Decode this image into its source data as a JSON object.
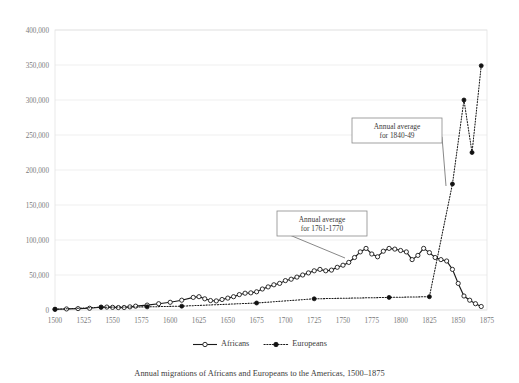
{
  "chart_data": {
    "type": "line",
    "title": "",
    "caption": "Annual migrations of Africans and Europeans to the Americas, 1500–1875",
    "xlabel": "",
    "ylabel": "",
    "xlim": [
      1500,
      1875
    ],
    "ylim": [
      0,
      400000
    ],
    "grid": true,
    "legend_position": "bottom",
    "x_ticks": [
      1500,
      1525,
      1550,
      1575,
      1600,
      1625,
      1650,
      1675,
      1700,
      1725,
      1750,
      1775,
      1800,
      1825,
      1850,
      1875
    ],
    "y_ticks": [
      0,
      50000,
      100000,
      150000,
      200000,
      250000,
      300000,
      350000,
      400000
    ],
    "y_tick_labels": [
      "0",
      "50,000",
      "100,000",
      "150,000",
      "200,000",
      "250,000",
      "300,000",
      "350,000",
      "400,000"
    ],
    "series": [
      {
        "name": "Africans",
        "marker": "open-circle",
        "line_style": "solid",
        "color": "#1a1a1a",
        "points": [
          [
            1500,
            1000
          ],
          [
            1510,
            1500
          ],
          [
            1520,
            2000
          ],
          [
            1530,
            2500
          ],
          [
            1540,
            4000
          ],
          [
            1545,
            4200
          ],
          [
            1550,
            3800
          ],
          [
            1555,
            3500
          ],
          [
            1560,
            3600
          ],
          [
            1565,
            4500
          ],
          [
            1570,
            5500
          ],
          [
            1580,
            7000
          ],
          [
            1590,
            9000
          ],
          [
            1600,
            11000
          ],
          [
            1610,
            14000
          ],
          [
            1620,
            18000
          ],
          [
            1625,
            19000
          ],
          [
            1630,
            16000
          ],
          [
            1635,
            13500
          ],
          [
            1640,
            13000
          ],
          [
            1645,
            15000
          ],
          [
            1650,
            17000
          ],
          [
            1655,
            19000
          ],
          [
            1660,
            22000
          ],
          [
            1665,
            24000
          ],
          [
            1670,
            24500
          ],
          [
            1675,
            26000
          ],
          [
            1680,
            30000
          ],
          [
            1685,
            33000
          ],
          [
            1690,
            36000
          ],
          [
            1695,
            38000
          ],
          [
            1700,
            42000
          ],
          [
            1705,
            44000
          ],
          [
            1710,
            47000
          ],
          [
            1715,
            50000
          ],
          [
            1720,
            53000
          ],
          [
            1725,
            56000
          ],
          [
            1730,
            58000
          ],
          [
            1735,
            56000
          ],
          [
            1740,
            57000
          ],
          [
            1745,
            61000
          ],
          [
            1750,
            64000
          ],
          [
            1755,
            68000
          ],
          [
            1760,
            75000
          ],
          [
            1765,
            83000
          ],
          [
            1770,
            88000
          ],
          [
            1775,
            80000
          ],
          [
            1780,
            76000
          ],
          [
            1785,
            84000
          ],
          [
            1790,
            88000
          ],
          [
            1795,
            87000
          ],
          [
            1800,
            85000
          ],
          [
            1805,
            83000
          ],
          [
            1810,
            72000
          ],
          [
            1815,
            78000
          ],
          [
            1820,
            88000
          ],
          [
            1825,
            82000
          ],
          [
            1830,
            75000
          ],
          [
            1835,
            72000
          ],
          [
            1840,
            70000
          ],
          [
            1845,
            58000
          ],
          [
            1850,
            38000
          ],
          [
            1855,
            20000
          ],
          [
            1860,
            14000
          ],
          [
            1865,
            9000
          ],
          [
            1870,
            5000
          ]
        ]
      },
      {
        "name": "Europeans",
        "marker": "filled-circle",
        "line_style": "dotted",
        "color": "#111111",
        "points": [
          [
            1500,
            1000
          ],
          [
            1540,
            4000
          ],
          [
            1580,
            4500
          ],
          [
            1610,
            5500
          ],
          [
            1675,
            10000
          ],
          [
            1725,
            16000
          ],
          [
            1790,
            18000
          ],
          [
            1825,
            19000
          ],
          [
            1845,
            180000
          ],
          [
            1855,
            300000
          ],
          [
            1862,
            225000
          ],
          [
            1870,
            349000
          ]
        ]
      }
    ],
    "annotations": [
      {
        "id": "annual-average-1761-1770",
        "line1": "Annual average",
        "line2": "for 1761-1770",
        "box": {
          "x": 277,
          "y": 211,
          "w": 90,
          "h": 25
        },
        "target": {
          "x": 345,
          "y": 258
        }
      },
      {
        "id": "annual-average-1840-49",
        "line1": "Annual average",
        "line2": "for 1840-49",
        "box": {
          "x": 352,
          "y": 118,
          "w": 90,
          "h": 25
        },
        "target": {
          "x": 446,
          "y": 186
        }
      }
    ],
    "legend": [
      {
        "label": "Africans",
        "marker": "open-circle",
        "line_style": "solid"
      },
      {
        "label": "Europeans",
        "marker": "filled-circle",
        "line_style": "dotted"
      }
    ]
  }
}
